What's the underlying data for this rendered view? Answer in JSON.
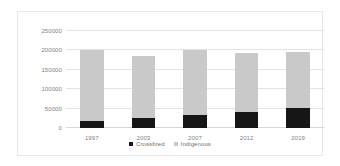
{
  "chart_data": {
    "type": "bar",
    "title": "",
    "subtitle": "",
    "xlabel": "",
    "ylabel": "",
    "stacked": true,
    "grid": true,
    "legend_position": "bottom",
    "categories": [
      "1997",
      "2003",
      "2007",
      "2012",
      "2019"
    ],
    "ylim": [
      0,
      250000
    ],
    "ytick_values": [
      0,
      50000,
      100000,
      150000,
      200000,
      250000
    ],
    "ytick_labels": [
      "0",
      "50000",
      "100000",
      "150000",
      "200000",
      "250000"
    ],
    "series": [
      {
        "name": "Crossbred",
        "color": "#161616",
        "values": [
          18000,
          25000,
          33000,
          41000,
          52000
        ]
      },
      {
        "name": "Indigenous",
        "color": "#c9c9c9",
        "values": [
          182000,
          160000,
          169000,
          152000,
          144000
        ]
      }
    ],
    "totals": [
      200000,
      185000,
      202000,
      193000,
      196000
    ]
  },
  "legend": {
    "items": [
      {
        "label": "Crossbred",
        "marker": "square-black-icon"
      },
      {
        "label": "Indigenous",
        "marker": "square-gray-icon"
      }
    ]
  }
}
